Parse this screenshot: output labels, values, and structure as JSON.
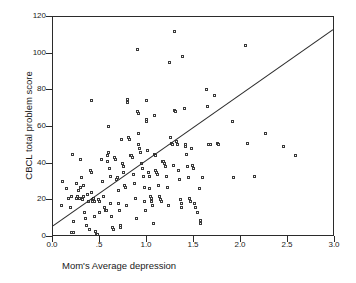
{
  "chart_data": {
    "type": "scatter",
    "title": "",
    "xlabel": "Mom's Average depression",
    "ylabel": "CBCL total problem score",
    "xlim": [
      0.0,
      3.0
    ],
    "ylim": [
      0,
      120
    ],
    "grid": false,
    "legend": null,
    "xticks": [
      0.0,
      0.5,
      1.0,
      1.5,
      2.0,
      2.5,
      3.0
    ],
    "xticklabels": [
      "0.0",
      ".5",
      "1.0",
      "1.5",
      "2.0",
      "2.5",
      "3.0"
    ],
    "yticks": [
      0,
      20,
      40,
      60,
      80,
      100,
      120
    ],
    "yticklabels": [
      "0",
      "20",
      "40",
      "60",
      "80",
      "100",
      "120"
    ],
    "marker": "open-square",
    "marker_color": "#3a3a3a",
    "series": [
      {
        "name": "observations",
        "points": [
          [
            0.1,
            17
          ],
          [
            0.11,
            30
          ],
          [
            0.15,
            26
          ],
          [
            0.17,
            21
          ],
          [
            0.19,
            16
          ],
          [
            0.2,
            22
          ],
          [
            0.21,
            45
          ],
          [
            0.22,
            8
          ],
          [
            0.2,
            2
          ],
          [
            0.22,
            2
          ],
          [
            0.25,
            29
          ],
          [
            0.26,
            21
          ],
          [
            0.27,
            22
          ],
          [
            0.28,
            25
          ],
          [
            0.29,
            21
          ],
          [
            0.3,
            42
          ],
          [
            0.3,
            27
          ],
          [
            0.31,
            32
          ],
          [
            0.31,
            21
          ],
          [
            0.32,
            20
          ],
          [
            0.33,
            28
          ],
          [
            0.33,
            22
          ],
          [
            0.34,
            13
          ],
          [
            0.35,
            10
          ],
          [
            0.36,
            6
          ],
          [
            0.37,
            23
          ],
          [
            0.38,
            19
          ],
          [
            0.39,
            4
          ],
          [
            0.4,
            36
          ],
          [
            0.41,
            35
          ],
          [
            0.42,
            74
          ],
          [
            0.42,
            24
          ],
          [
            0.43,
            19
          ],
          [
            0.43,
            20
          ],
          [
            0.44,
            21
          ],
          [
            0.45,
            19
          ],
          [
            0.45,
            11
          ],
          [
            0.46,
            3
          ],
          [
            0.47,
            1
          ],
          [
            0.48,
            1
          ],
          [
            0.49,
            20
          ],
          [
            0.5,
            19
          ],
          [
            0.5,
            13
          ],
          [
            0.52,
            42
          ],
          [
            0.53,
            30
          ],
          [
            0.54,
            22
          ],
          [
            0.55,
            16
          ],
          [
            0.56,
            14
          ],
          [
            0.57,
            14
          ],
          [
            0.58,
            41
          ],
          [
            0.59,
            44
          ],
          [
            0.6,
            60
          ],
          [
            0.6,
            46
          ],
          [
            0.61,
            37
          ],
          [
            0.62,
            33
          ],
          [
            0.62,
            18
          ],
          [
            0.63,
            11
          ],
          [
            0.64,
            5
          ],
          [
            0.65,
            4
          ],
          [
            0.66,
            43
          ],
          [
            0.67,
            42
          ],
          [
            0.68,
            31
          ],
          [
            0.69,
            32
          ],
          [
            0.7,
            25
          ],
          [
            0.7,
            18
          ],
          [
            0.71,
            14
          ],
          [
            0.72,
            6
          ],
          [
            0.72,
            5
          ],
          [
            0.73,
            53
          ],
          [
            0.74,
            40
          ],
          [
            0.75,
            38
          ],
          [
            0.76,
            35
          ],
          [
            0.77,
            28
          ],
          [
            0.78,
            27
          ],
          [
            0.79,
            17
          ],
          [
            0.8,
            75
          ],
          [
            0.8,
            73
          ],
          [
            0.81,
            54
          ],
          [
            0.82,
            53
          ],
          [
            0.83,
            44
          ],
          [
            0.84,
            44
          ],
          [
            0.85,
            43
          ],
          [
            0.86,
            34
          ],
          [
            0.87,
            29
          ],
          [
            0.88,
            21
          ],
          [
            0.89,
            10
          ],
          [
            0.9,
            102
          ],
          [
            0.9,
            68
          ],
          [
            0.91,
            67
          ],
          [
            0.92,
            56
          ],
          [
            0.92,
            50
          ],
          [
            0.93,
            48
          ],
          [
            0.94,
            46
          ],
          [
            0.95,
            40
          ],
          [
            0.96,
            37
          ],
          [
            0.97,
            33
          ],
          [
            0.98,
            27
          ],
          [
            0.98,
            19
          ],
          [
            0.99,
            14
          ],
          [
            1.0,
            74
          ],
          [
            1.0,
            64
          ],
          [
            1.0,
            63
          ],
          [
            1.01,
            47
          ],
          [
            1.02,
            35
          ],
          [
            1.03,
            33
          ],
          [
            1.03,
            26
          ],
          [
            1.04,
            22
          ],
          [
            1.05,
            21
          ],
          [
            1.05,
            19
          ],
          [
            1.06,
            17
          ],
          [
            1.07,
            7
          ],
          [
            1.08,
            66
          ],
          [
            1.09,
            45
          ],
          [
            1.1,
            44
          ],
          [
            1.1,
            36
          ],
          [
            1.11,
            35
          ],
          [
            1.12,
            34
          ],
          [
            1.13,
            28
          ],
          [
            1.14,
            22
          ],
          [
            1.15,
            20
          ],
          [
            1.16,
            19
          ],
          [
            1.17,
            41
          ],
          [
            1.18,
            41
          ],
          [
            1.19,
            40
          ],
          [
            1.2,
            38
          ],
          [
            1.21,
            33
          ],
          [
            1.22,
            27
          ],
          [
            1.23,
            17
          ],
          [
            1.24,
            95
          ],
          [
            1.26,
            54
          ],
          [
            1.27,
            51
          ],
          [
            1.28,
            50
          ],
          [
            1.29,
            39
          ],
          [
            1.3,
            112
          ],
          [
            1.3,
            69
          ],
          [
            1.31,
            68
          ],
          [
            1.32,
            52
          ],
          [
            1.33,
            50
          ],
          [
            1.34,
            36
          ],
          [
            1.35,
            31
          ],
          [
            1.36,
            20
          ],
          [
            1.37,
            18
          ],
          [
            1.37,
            16
          ],
          [
            1.38,
            98
          ],
          [
            1.4,
            70
          ],
          [
            1.41,
            50
          ],
          [
            1.42,
            49
          ],
          [
            1.43,
            45
          ],
          [
            1.44,
            38
          ],
          [
            1.45,
            32
          ],
          [
            1.46,
            21
          ],
          [
            1.47,
            19
          ],
          [
            1.48,
            48
          ],
          [
            1.49,
            39
          ],
          [
            1.5,
            37
          ],
          [
            1.51,
            18
          ],
          [
            1.52,
            16
          ],
          [
            1.54,
            13
          ],
          [
            1.56,
            26
          ],
          [
            1.57,
            9
          ],
          [
            1.57,
            7
          ],
          [
            1.6,
            32
          ],
          [
            1.64,
            80
          ],
          [
            1.65,
            71
          ],
          [
            1.66,
            50
          ],
          [
            1.68,
            50
          ],
          [
            1.72,
            77
          ],
          [
            1.75,
            51
          ],
          [
            1.77,
            50
          ],
          [
            1.92,
            63
          ],
          [
            1.93,
            32
          ],
          [
            2.05,
            104
          ],
          [
            2.07,
            51
          ],
          [
            2.15,
            33
          ],
          [
            2.27,
            56
          ],
          [
            2.46,
            49
          ],
          [
            2.59,
            44
          ]
        ]
      }
    ],
    "fit_line": {
      "name": "regression-line",
      "x_start": 0.0,
      "y_start": 5,
      "x_end": 3.0,
      "y_end": 113,
      "color": "#2b2b2b"
    }
  }
}
